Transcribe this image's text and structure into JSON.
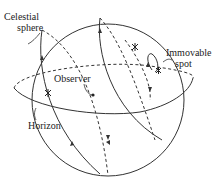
{
  "diagram": {
    "labels": {
      "celestial_sphere_line1": "Celestial",
      "celestial_sphere_line2": "sphere",
      "immovable_spot_line1": "Immovable",
      "immovable_spot_line2": "spot",
      "observer": "Observer",
      "horizon": "Horizon"
    },
    "elements": [
      "celestial-sphere",
      "horizon-circle",
      "star-trails",
      "stars",
      "observer-point",
      "immovable-spot"
    ],
    "colors": {
      "line": "#333333",
      "text": "#222222",
      "background": "#ffffff"
    }
  }
}
